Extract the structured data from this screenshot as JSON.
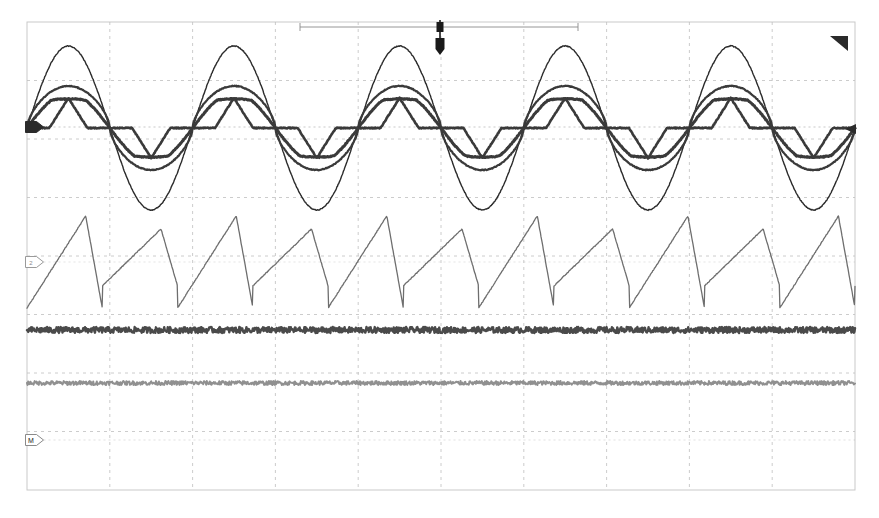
{
  "display": {
    "name": "oscilloscope-waveform-display",
    "width": 879,
    "height": 518,
    "background_color": "#ffffff"
  },
  "graticule": {
    "name": "graticule",
    "left": 27,
    "top": 22,
    "right": 855,
    "bottom": 490,
    "horizontal_divisions": 10,
    "vertical_divisions": 8,
    "border_color": "#c9c9c9",
    "gridline_color": "#bfbfbf",
    "gridline_style": "dashed",
    "center_line_y": 256
  },
  "acquisition_bar": {
    "name": "acquisition-window-bar",
    "left": 300,
    "right": 578,
    "y": 27,
    "color": "#8a8a8a",
    "label": ""
  },
  "trigger_marker": {
    "name": "trigger-position-marker",
    "x": 440,
    "y": 36,
    "color": "#1a1a1a",
    "label": "T"
  },
  "corner_marker": {
    "name": "trigger-level-corner-marker",
    "x": 848,
    "y": 36,
    "color": "#2a2a2a"
  },
  "channel_markers": [
    {
      "name": "channel-marker-1",
      "label": "1",
      "x": 33,
      "y": 127,
      "color": "#2b2b2b",
      "style": "filled"
    },
    {
      "name": "channel-marker-2",
      "label": "2",
      "x": 33,
      "y": 262,
      "color": "#9a9a9a",
      "style": "outline"
    },
    {
      "name": "channel-marker-math",
      "label": "M",
      "x": 33,
      "y": 440,
      "color": "#8a8a8a",
      "style": "outline"
    }
  ],
  "right_edge_marker": {
    "name": "right-edge-level-marker",
    "x": 851,
    "y": 129,
    "color": "#2b2b2b"
  },
  "chart_data": {
    "type": "line",
    "title": "",
    "xlabel": "",
    "ylabel": "",
    "grid": true,
    "legend_position": "none",
    "x_range_px": [
      27,
      855
    ],
    "y_range_px": [
      22,
      490
    ],
    "series": [
      {
        "name": "ch1-large-sine",
        "waveform": "sine",
        "color": "#2b2b2b",
        "stroke_width": 1.4,
        "baseline_y": 128,
        "amplitude_px": 82,
        "cycles": 5,
        "phase_deg": 0,
        "opacity": 1
      },
      {
        "name": "ch1-medium-sine",
        "waveform": "sine-flattop",
        "color": "#3a3a3a",
        "stroke_width": 2.2,
        "baseline_y": 128,
        "amplitude_px": 42,
        "cycles": 5,
        "phase_deg": 0,
        "opacity": 1
      },
      {
        "name": "ch1-small-rounded",
        "waveform": "sine-clipped",
        "color": "#3a3a3a",
        "stroke_width": 3.0,
        "baseline_y": 128,
        "amplitude_px": 30,
        "cycles": 5,
        "phase_deg": 0,
        "opacity": 1
      },
      {
        "name": "ch1-trapezoid",
        "waveform": "trapezoid",
        "color": "#3a3a3a",
        "stroke_width": 2.6,
        "baseline_y": 128,
        "amplitude_px": 30,
        "cycles": 5,
        "phase_deg": 0,
        "opacity": 1
      },
      {
        "name": "ch2-sawtooth-beat",
        "waveform": "sawtooth-beat",
        "color": "#6e6e6e",
        "stroke_width": 1.3,
        "baseline_y": 262,
        "amplitude_px": 46,
        "cycles": 11,
        "phase_deg": 0,
        "opacity": 1
      },
      {
        "name": "math-noisy-trace-dark",
        "waveform": "noise-flat",
        "color": "#4a4a4a",
        "stroke_width": 2.4,
        "baseline_y": 330,
        "amplitude_px": 3,
        "cycles": 0,
        "phase_deg": 0,
        "opacity": 1
      },
      {
        "name": "math-noisy-trace-light",
        "waveform": "noise-flat",
        "color": "#909090",
        "stroke_width": 2.0,
        "baseline_y": 383,
        "amplitude_px": 2,
        "cycles": 0,
        "phase_deg": 0,
        "opacity": 1
      }
    ]
  }
}
